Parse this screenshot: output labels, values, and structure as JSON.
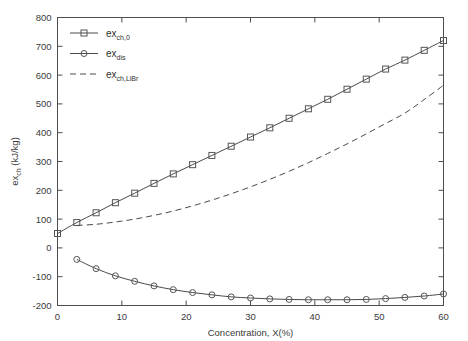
{
  "chart_data": {
    "type": "line",
    "title": "",
    "xlabel": "Concentration, X(%)",
    "ylabel": "ex_ch (kJ/kg)",
    "ylabel_base": "ex",
    "ylabel_sub": "ch",
    "ylabel_unit": " (kJ/kg)",
    "xlim": [
      0,
      60
    ],
    "ylim": [
      -200,
      800
    ],
    "xticks": [
      0,
      10,
      20,
      30,
      40,
      50,
      60
    ],
    "yticks": [
      -200,
      -100,
      0,
      100,
      200,
      300,
      400,
      500,
      600,
      700,
      800
    ],
    "grid": false,
    "legend_position": "upper-left",
    "series": [
      {
        "name": "ex_ch,0",
        "label_base": "ex",
        "label_sub": "ch,0",
        "style": "solid",
        "marker": "square",
        "color": "#4a4a4a",
        "x": [
          0,
          3,
          6,
          9,
          12,
          15,
          18,
          21,
          24,
          27,
          30,
          33,
          36,
          39,
          42,
          45,
          48,
          51,
          54,
          57,
          60
        ],
        "y": [
          50,
          88,
          122,
          157,
          190,
          224,
          257,
          289,
          321,
          353,
          385,
          417,
          450,
          483,
          516,
          551,
          586,
          621,
          652,
          686,
          720
        ]
      },
      {
        "name": "ex_dis",
        "label_base": "ex",
        "label_sub": "dis",
        "style": "solid",
        "marker": "circle",
        "color": "#4a4a4a",
        "x": [
          3,
          6,
          9,
          12,
          15,
          18,
          21,
          24,
          27,
          30,
          33,
          36,
          39,
          42,
          45,
          48,
          51,
          54,
          57,
          60
        ],
        "y": [
          -40,
          -72,
          -97,
          -116,
          -132,
          -145,
          -155,
          -163,
          -170,
          -174,
          -177,
          -179,
          -180,
          -180,
          -180,
          -179,
          -176,
          -172,
          -167,
          -160
        ]
      },
      {
        "name": "ex_ch,LiBr",
        "label_base": "ex",
        "label_sub": "ch,LiBr",
        "style": "dashed",
        "marker": "none",
        "color": "#4a4a4a",
        "x": [
          3,
          6,
          9,
          12,
          15,
          18,
          21,
          24,
          27,
          30,
          33,
          36,
          39,
          42,
          45,
          48,
          51,
          54,
          57,
          60
        ],
        "y": [
          78,
          82,
          90,
          100,
          113,
          128,
          146,
          166,
          188,
          212,
          238,
          266,
          296,
          328,
          361,
          396,
          432,
          468,
          515,
          565
        ]
      }
    ],
    "legend": [
      {
        "label_base": "ex",
        "label_sub": "ch,0",
        "style": "solid",
        "marker": "square"
      },
      {
        "label_base": "ex",
        "label_sub": "dis",
        "style": "solid",
        "marker": "circle"
      },
      {
        "label_base": "ex",
        "label_sub": "ch,LiBr",
        "style": "dashed",
        "marker": "none"
      }
    ]
  }
}
